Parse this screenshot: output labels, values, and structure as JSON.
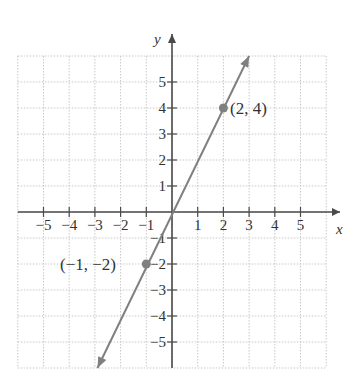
{
  "chart_data": {
    "type": "line",
    "title": "",
    "xlabel": "x",
    "ylabel": "y",
    "xlim": [
      -6,
      6
    ],
    "ylim": [
      -6,
      6
    ],
    "grid": true,
    "x_ticks": [
      -5,
      -4,
      -3,
      -2,
      -1,
      1,
      2,
      3,
      4,
      5
    ],
    "y_ticks": [
      -5,
      -4,
      -3,
      -2,
      -1,
      1,
      2,
      3,
      4,
      5
    ],
    "x_tick_labels": [
      "−5",
      "−4",
      "−3",
      "−2",
      "−1",
      "1",
      "2",
      "3",
      "4",
      "5"
    ],
    "y_tick_labels": [
      "−5",
      "−4",
      "−3",
      "−2",
      "−1",
      "1",
      "2",
      "3",
      "4",
      "5"
    ],
    "series": [
      {
        "name": "y = 2x",
        "equation": "y = 2x",
        "x": [
          -2.9,
          3.0
        ],
        "y": [
          -6.0,
          6.0
        ],
        "arrows": "both",
        "color": "#808080"
      }
    ],
    "points": [
      {
        "x": 2,
        "y": 4,
        "label": "(2, 4)"
      },
      {
        "x": -1,
        "y": -2,
        "label": "(−1, −2)"
      }
    ]
  },
  "labels": {
    "x_axis": "x",
    "y_axis": "y",
    "point_a": "(2, 4)",
    "point_b": "(−1, −2)"
  },
  "colors": {
    "axis": "#4a4a4a",
    "grid": "#c8c8c8",
    "line": "#8a8a8a",
    "point": "#808080"
  }
}
